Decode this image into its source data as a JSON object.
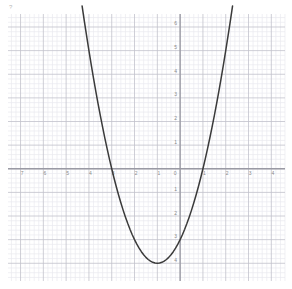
{
  "page": {
    "background_color": "#ffffff",
    "corner_mark": "?"
  },
  "colors": {
    "minor_grid": "#e9e9ef",
    "major_grid": "#c2c2cc",
    "axis": "#9a9aa4",
    "curve": "#3a3a3a",
    "tick_text": "#8a8a8a"
  },
  "chart_data": {
    "type": "line",
    "title": "",
    "subtitle": "",
    "xlabel": "",
    "ylabel": "",
    "equation": "y = x^2 + 2x - 3",
    "grid": true,
    "grid_minor_subdivisions": 5,
    "legend": "none",
    "legend_position": "none",
    "xlim": [
      -7.55,
      4.6
    ],
    "ylim": [
      -4.75,
      6.55
    ],
    "x_ticks": [
      -7,
      -6,
      -5,
      -4,
      -3,
      -2,
      -1,
      0,
      1,
      2,
      3,
      4
    ],
    "x_tick_labels": [
      "7",
      "6",
      "5",
      "4",
      "3",
      "2",
      "1",
      "0",
      "1",
      "2",
      "3",
      "4"
    ],
    "y_ticks": [
      -4,
      -3,
      -2,
      -1,
      0,
      1,
      2,
      3,
      4,
      5,
      6
    ],
    "y_tick_labels": [
      "4",
      "3",
      "2",
      "1",
      "0",
      "1",
      "2",
      "3",
      "4",
      "5",
      "6"
    ],
    "vertex": [
      -1,
      -4
    ],
    "roots": [
      -3,
      1
    ],
    "y_intercept": -3,
    "series": [
      {
        "name": "y = x^2 + 2x - 3",
        "color": "#3a3a3a",
        "x": [
          -4.3,
          -4.2,
          -4.1,
          -4.0,
          -3.9,
          -3.8,
          -3.7,
          -3.6,
          -3.5,
          -3.4,
          -3.3,
          -3.2,
          -3.1,
          -3.0,
          -2.9,
          -2.8,
          -2.7,
          -2.6,
          -2.5,
          -2.4,
          -2.3,
          -2.2,
          -2.1,
          -2.0,
          -1.9,
          -1.8,
          -1.7,
          -1.6,
          -1.5,
          -1.4,
          -1.3,
          -1.2,
          -1.1,
          -1.0,
          -0.9,
          -0.8,
          -0.7,
          -0.6,
          -0.5,
          -0.4,
          -0.3,
          -0.2,
          -0.1,
          0.0,
          0.1,
          0.2,
          0.3,
          0.4,
          0.5,
          0.6,
          0.7,
          0.8,
          0.9,
          1.0,
          1.1,
          1.2,
          1.3,
          1.4,
          1.5,
          1.6,
          1.7,
          1.8,
          1.9,
          2.0,
          2.1,
          2.2,
          2.3
        ],
        "y": [
          6.89,
          6.24,
          5.61,
          5.0,
          4.41,
          3.84,
          3.29,
          2.76,
          2.25,
          1.76,
          1.29,
          0.84,
          0.41,
          0.0,
          -0.39,
          -0.76,
          -1.11,
          -1.44,
          -1.75,
          -2.04,
          -2.31,
          -2.56,
          -2.79,
          -3.0,
          -3.19,
          -3.36,
          -3.51,
          -3.64,
          -3.75,
          -3.84,
          -3.91,
          -3.96,
          -3.99,
          -4.0,
          -3.99,
          -3.96,
          -3.91,
          -3.84,
          -3.75,
          -3.64,
          -3.51,
          -3.36,
          -3.19,
          -3.0,
          -2.79,
          -2.56,
          -2.31,
          -2.04,
          -1.75,
          -1.44,
          -1.11,
          -0.76,
          -0.39,
          0.0,
          0.41,
          0.84,
          1.29,
          1.76,
          2.25,
          2.76,
          3.29,
          3.84,
          4.41,
          5.0,
          5.61,
          6.24,
          6.89
        ]
      }
    ]
  }
}
